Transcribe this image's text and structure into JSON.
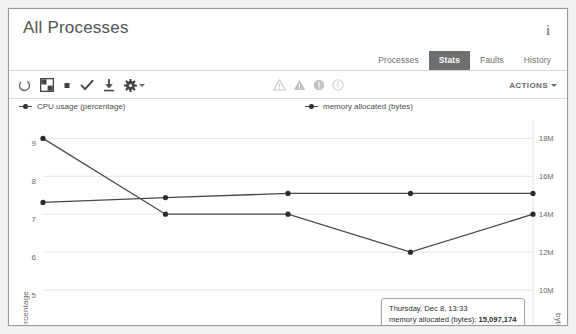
{
  "window": {
    "title": "All Processes",
    "info_icon": "info-icon"
  },
  "tabs": [
    {
      "label": "Processes",
      "active": false
    },
    {
      "label": "Stats",
      "active": true
    },
    {
      "label": "Faults",
      "active": false
    },
    {
      "label": "History",
      "active": false
    }
  ],
  "toolbar": {
    "left_icons": [
      "refresh-icon",
      "grid-layout-icon",
      "stop-square-icon",
      "check-icon",
      "download-icon",
      "gear-dropdown-icon"
    ],
    "status_icons": [
      "warning-triangle-outline-icon",
      "warning-triangle-filled-icon",
      "info-circle-filled-icon",
      "info-circle-outline-icon"
    ],
    "actions_label": "ACTIONS"
  },
  "legend": [
    {
      "label": "CPU usage (percentage)",
      "key": "cpu"
    },
    {
      "label": "memory allocated (bytes)",
      "key": "memory"
    }
  ],
  "tooltip": {
    "timestamp": "Thursday, Dec 8, 13:33",
    "metric_label": "memory allocated (bytes):",
    "value": "15,097,174"
  },
  "colors": {
    "line": "#4a4a4a",
    "point": "#2b2b2b",
    "grid": "#e4e4e4",
    "tab_active_bg": "#6e6e6e",
    "text": "#6a6a6a"
  },
  "chart_data": {
    "type": "line",
    "title": "",
    "xlabel": "",
    "grid": true,
    "legend_position": "top",
    "x": [
      0,
      1,
      2,
      3,
      4
    ],
    "axes": {
      "left": {
        "label": "percentage",
        "ticks": [
          9,
          8,
          7,
          6,
          5
        ],
        "tick_labels": [
          "9",
          "8",
          "7",
          "6",
          "5"
        ],
        "lim": [
          4.5,
          9.3
        ]
      },
      "right": {
        "label": "bytes",
        "ticks": [
          18000000,
          16000000,
          14000000,
          12000000,
          10000000
        ],
        "tick_labels": [
          "18M",
          "16M",
          "14M",
          "12M",
          "10M"
        ],
        "lim": [
          9000000,
          18600000
        ]
      }
    },
    "series": [
      {
        "name": "CPU usage (percentage)",
        "axis": "left",
        "values": [
          9.0,
          7.0,
          7.0,
          6.0,
          7.0
        ]
      },
      {
        "name": "memory allocated (bytes)",
        "axis": "right",
        "values": [
          14620000,
          14880000,
          15097174,
          15097174,
          15097174
        ]
      }
    ]
  }
}
